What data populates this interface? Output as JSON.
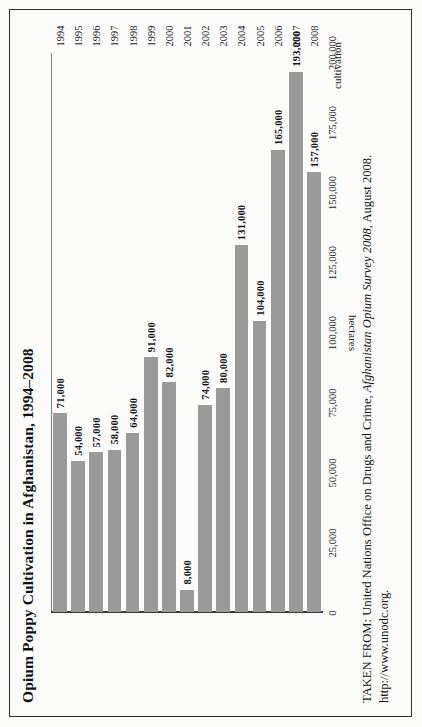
{
  "page": {
    "frame_color": "#2e2e2e",
    "background": "#fbfbfa"
  },
  "chart_data": {
    "type": "bar",
    "orientation": "vertical",
    "title": "Opium Poppy Cultivation in Afghanistan, 1994–2008",
    "xlabel": "cultivation",
    "ylabel": "hectares",
    "categories": [
      "1994",
      "1995",
      "1996",
      "1997",
      "1998",
      "1999",
      "2000",
      "2001",
      "2002",
      "2003",
      "2004",
      "2005",
      "2006",
      "2007",
      "2008"
    ],
    "values": [
      71000,
      54000,
      57000,
      58000,
      64000,
      91000,
      82000,
      8000,
      74000,
      80000,
      131000,
      104000,
      165000,
      193000,
      157000
    ],
    "data_labels": [
      "71,000",
      "54,000",
      "57,000",
      "58,000",
      "64,000",
      "91,000",
      "82,000",
      "8,000",
      "74,000",
      "80,000",
      "131,000",
      "104,000",
      "165,000",
      "193,000",
      "157,000"
    ],
    "ytick_labels": [
      "0",
      "25,000",
      "50,000",
      "75,000",
      "100,000",
      "125,000",
      "150,000",
      "175,000",
      "200,000"
    ],
    "ytick_values": [
      0,
      25000,
      50000,
      75000,
      100000,
      125000,
      150000,
      175000,
      200000
    ],
    "ylim": [
      0,
      200000
    ],
    "grid": false,
    "legend": false,
    "bar_color": "#9a9a9a",
    "axis_color": "#3a3a3a"
  },
  "source": {
    "prefix": "TAKEN FROM: United Nations Office on Drugs and Crime, ",
    "italic": "Afghanistan Opium Survey 2008",
    "suffix": ", August 2008.",
    "url": "http://www.unodc.org."
  }
}
